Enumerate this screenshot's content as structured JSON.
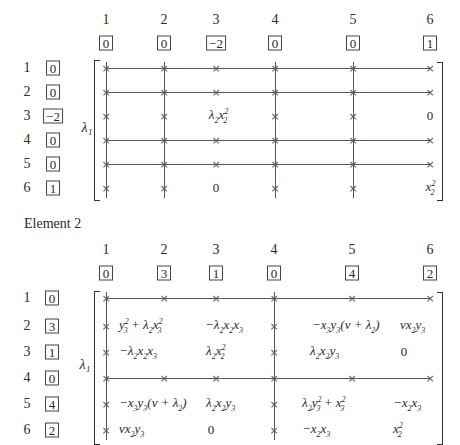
{
  "matrix1": {
    "column_labels": [
      "1",
      "2",
      "3",
      "4",
      "5",
      "6"
    ],
    "column_boxes": [
      "0",
      "0",
      "−2",
      "0",
      "0",
      "1"
    ],
    "row_labels": [
      "1",
      "2",
      "3",
      "4",
      "5",
      "6"
    ],
    "row_boxes": [
      "0",
      "0",
      "−2",
      "0",
      "0",
      "1"
    ],
    "prefactor": "λ₁",
    "entries": {
      "r3c3": "λ₂x₂²",
      "r3c6": "0",
      "r6c3": "0",
      "r6c6": "x₂²"
    }
  },
  "caption": "Element  2",
  "matrix2": {
    "column_labels": [
      "1",
      "2",
      "3",
      "4",
      "5",
      "6"
    ],
    "column_boxes": [
      "0",
      "3",
      "1",
      "0",
      "4",
      "2"
    ],
    "row_labels": [
      "1",
      "2",
      "3",
      "4",
      "5",
      "6"
    ],
    "row_boxes": [
      "0",
      "3",
      "1",
      "0",
      "4",
      "2"
    ],
    "prefactor": "λ₁",
    "entries": {
      "r2c2": "y₃² + λ₂x₃²",
      "r2c3": "−λ₂x₂x₃",
      "r2c5": "−x₃y₃(v + λ₂)",
      "r2c6": "vx₂y₃",
      "r3c2": "−λ₂x₂x₃",
      "r3c3": "λ₂x₂²",
      "r3c5": "λ₂x₂y₃",
      "r3c6": "0",
      "r5c2": "−x₃y₃(v + λ₂)",
      "r5c3": "λ₂x₂y₃",
      "r5c5": "λ₂y₃² + x₃²",
      "r5c6": "−x₂x₃",
      "r6c2": "vx₂y₃",
      "r6c3": "0",
      "r6c5": "−x₂x₃",
      "r6c6": "x₂²"
    }
  },
  "marker_glyph": "×"
}
